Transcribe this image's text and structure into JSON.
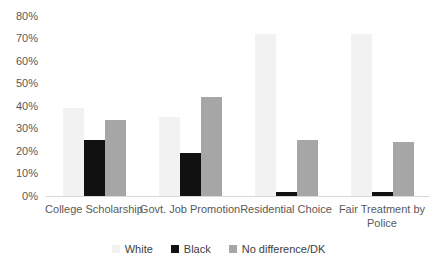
{
  "chart_data": {
    "type": "bar",
    "categories": [
      "College Scholarship",
      "Govt. Job Promotion",
      "Residential Choice",
      "Fair Treatment by Police"
    ],
    "series": [
      {
        "name": "White",
        "color": "#f2f2f2",
        "values": [
          39,
          35,
          72,
          72
        ]
      },
      {
        "name": "Black",
        "color": "#111111",
        "values": [
          25,
          19,
          2,
          2
        ]
      },
      {
        "name": "No difference/DK",
        "color": "#a6a6a6",
        "values": [
          34,
          44,
          25,
          24
        ]
      }
    ],
    "ylim": [
      0,
      80
    ],
    "yticks": [
      "0%",
      "10%",
      "20%",
      "30%",
      "40%",
      "50%",
      "60%",
      "70%",
      "80%"
    ],
    "grid": "off",
    "legend_position": "bottom",
    "title": "",
    "xlabel": "",
    "ylabel": "",
    "axis_line_color": "#d9d9d9"
  }
}
